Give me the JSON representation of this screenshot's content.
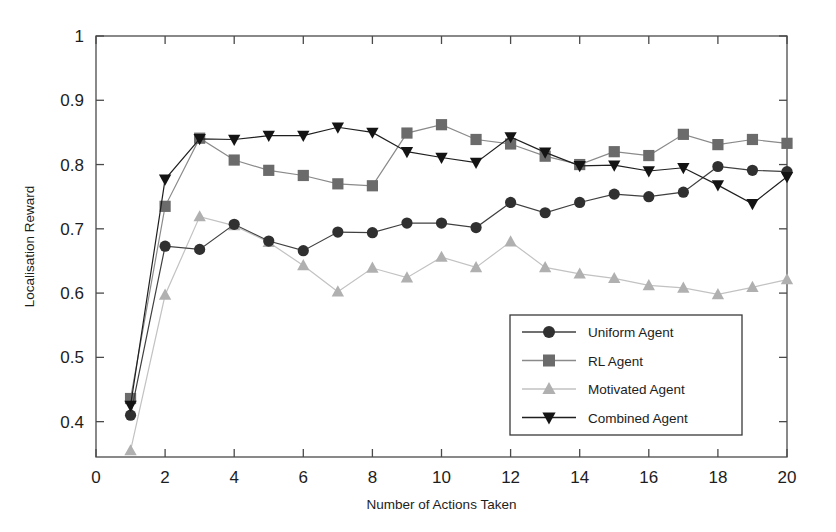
{
  "chart_data": {
    "type": "line",
    "title": "",
    "xlabel": "Number of Actions Taken",
    "ylabel": "Localisation Reward",
    "xlim": [
      0,
      20
    ],
    "ylim": [
      0.345,
      1.0
    ],
    "xticks": [
      0,
      2,
      4,
      6,
      8,
      10,
      12,
      14,
      16,
      18,
      20
    ],
    "xtick_labels": [
      "0",
      "2",
      "4",
      "6",
      "8",
      "10",
      "12",
      "14",
      "16",
      "18",
      "20"
    ],
    "yticks": [
      0.4,
      0.5,
      0.6,
      0.7,
      0.8,
      0.9,
      1.0
    ],
    "ytick_labels": [
      "0.4",
      "0.5",
      "0.6",
      "0.7",
      "0.8",
      "0.9",
      "1"
    ],
    "grid": false,
    "legend_position": "lower right",
    "x": [
      1,
      2,
      3,
      4,
      5,
      6,
      7,
      8,
      9,
      10,
      11,
      12,
      13,
      14,
      15,
      16,
      17,
      18,
      19,
      20
    ],
    "series": [
      {
        "name": "Uniform Agent",
        "marker": "circle",
        "color": "#303030",
        "line_color": "#404040",
        "values": [
          0.41,
          0.673,
          0.668,
          0.707,
          0.681,
          0.666,
          0.695,
          0.694,
          0.709,
          0.709,
          0.702,
          0.741,
          0.725,
          0.741,
          0.754,
          0.75,
          0.757,
          0.797,
          0.791,
          0.789
        ]
      },
      {
        "name": "RL Agent",
        "marker": "square",
        "color": "#6b6b6b",
        "line_color": "#8a8a8a",
        "values": [
          0.436,
          0.735,
          0.841,
          0.807,
          0.791,
          0.783,
          0.77,
          0.767,
          0.849,
          0.862,
          0.839,
          0.832,
          0.813,
          0.8,
          0.82,
          0.814,
          0.847,
          0.831,
          0.839,
          0.833
        ]
      },
      {
        "name": "Motivated Agent",
        "marker": "triangle-up",
        "color": "#b0b0b0",
        "line_color": "#c2c2c2",
        "values": [
          0.355,
          0.597,
          0.719,
          0.705,
          0.679,
          0.643,
          0.602,
          0.639,
          0.624,
          0.656,
          0.64,
          0.68,
          0.64,
          0.63,
          0.623,
          0.612,
          0.608,
          0.598,
          0.609,
          0.621
        ]
      },
      {
        "name": "Combined Agent",
        "marker": "triangle-down",
        "color": "#141414",
        "line_color": "#1f1f1f",
        "values": [
          0.425,
          0.777,
          0.84,
          0.839,
          0.845,
          0.845,
          0.858,
          0.85,
          0.82,
          0.811,
          0.803,
          0.843,
          0.819,
          0.798,
          0.799,
          0.79,
          0.795,
          0.768,
          0.739,
          0.781
        ]
      }
    ]
  },
  "legend": {
    "entries": [
      "Uniform Agent",
      "RL Agent",
      "Motivated Agent",
      "Combined Agent"
    ]
  }
}
